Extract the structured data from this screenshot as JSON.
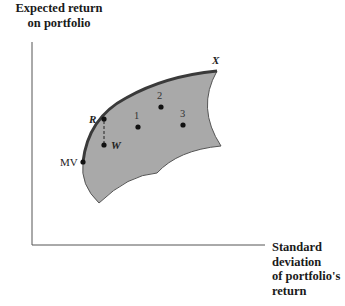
{
  "diagram": {
    "y_axis_label": "Expected return on portfolio",
    "x_axis_label": "Standard deviation of portfolio's return",
    "y_axis_label_lines": [
      "Expected return",
      "on portfolio"
    ],
    "x_axis_label_lines": [
      "Standard",
      "deviation",
      "of portfolio's",
      "return"
    ],
    "region_fill": "#a9a9a9",
    "frontier_color": "#444444",
    "points": [
      {
        "id": "R",
        "label": "R",
        "x": 104,
        "y": 119
      },
      {
        "id": "W",
        "label": "W",
        "x": 104,
        "y": 145
      },
      {
        "id": "MV",
        "label": "MV",
        "x": 83,
        "y": 162
      },
      {
        "id": "1",
        "label": "1",
        "x": 138,
        "y": 127
      },
      {
        "id": "2",
        "label": "2",
        "x": 161,
        "y": 107
      },
      {
        "id": "3",
        "label": "3",
        "x": 183,
        "y": 125
      },
      {
        "id": "X",
        "label": "X",
        "x": 217,
        "y": 71
      }
    ],
    "annotations": {
      "arrow_R_to_W": "dashed line from R down to W"
    }
  }
}
